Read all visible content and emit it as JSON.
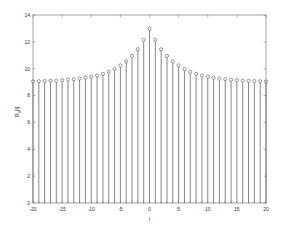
{
  "chart_data": {
    "type": "stem",
    "title": "",
    "xlabel": "l",
    "ylabel": "R_{ll}[l]",
    "xlim": [
      -20,
      20
    ],
    "ylim": [
      0,
      14
    ],
    "xticks": [
      -20,
      -15,
      -10,
      -5,
      0,
      5,
      10,
      15,
      20
    ],
    "yticks": [
      0,
      2,
      4,
      6,
      8,
      10,
      12,
      14
    ],
    "grid": false,
    "legend": null,
    "x": [
      -20,
      -19,
      -18,
      -17,
      -16,
      -15,
      -14,
      -13,
      -12,
      -11,
      -10,
      -9,
      -8,
      -7,
      -6,
      -5,
      -4,
      -3,
      -2,
      -1,
      0,
      1,
      2,
      3,
      4,
      5,
      6,
      7,
      8,
      9,
      10,
      11,
      12,
      13,
      14,
      15,
      16,
      17,
      18,
      19,
      20
    ],
    "values": [
      9.05,
      9.07,
      9.08,
      9.1,
      9.12,
      9.15,
      9.18,
      9.22,
      9.27,
      9.33,
      9.4,
      9.5,
      9.62,
      9.77,
      9.97,
      10.25,
      10.55,
      10.95,
      11.45,
      12.15,
      13.0,
      12.15,
      11.45,
      10.95,
      10.55,
      10.25,
      9.97,
      9.77,
      9.62,
      9.5,
      9.4,
      9.33,
      9.27,
      9.22,
      9.18,
      9.15,
      9.12,
      9.1,
      9.08,
      9.07,
      9.05
    ],
    "marker": "circle",
    "color": "#555555"
  },
  "labels": {
    "xlabel": "l",
    "ylabel_main": "R",
    "ylabel_sub": "ll",
    "ylabel_tail": "[l]"
  }
}
